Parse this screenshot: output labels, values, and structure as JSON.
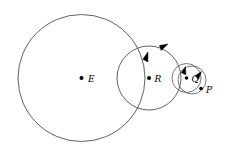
{
  "figure": {
    "background_color": "#ffffff",
    "stroke_color": "#3a3a3a",
    "dot_color": "#000000",
    "arrow_color": "#000000",
    "width": 225,
    "height": 157,
    "points": [
      {
        "id": "E",
        "label": "E",
        "cx": 81.5,
        "cy": 78.0,
        "label_x": 88.0,
        "label_y": 81.5,
        "dot_r": 2.0
      },
      {
        "id": "R",
        "label": "R",
        "cx": 149.0,
        "cy": 78.0,
        "label_x": 154.5,
        "label_y": 81.5,
        "dot_r": 2.0
      },
      {
        "id": "Q",
        "label": "Q",
        "cx": 186.5,
        "cy": 78.0,
        "label_x": 191.5,
        "label_y": 81.5,
        "dot_r": 1.8
      },
      {
        "id": "P",
        "label": "P",
        "cx": 201.0,
        "cy": 88.5,
        "label_x": 206.0,
        "label_y": 93.0,
        "dot_r": 1.8
      }
    ],
    "circles": [
      {
        "id": "deferent-E",
        "center": "E",
        "cx": 81.5,
        "cy": 78.0,
        "r": 63.5
      },
      {
        "id": "epicycle-R",
        "center": "R",
        "cx": 149.0,
        "cy": 78.0,
        "r": 32.0
      },
      {
        "id": "epicycle-Q",
        "center": "Q",
        "cx": 186.5,
        "cy": 78.0,
        "r": 14.5
      },
      {
        "id": "epicycle-P",
        "center": "P",
        "cx": 192.0,
        "cy": 80.0,
        "r": 14.0
      }
    ],
    "arrows": [
      {
        "id": "arrow-on-deferent-E",
        "x": 168.0,
        "y": 44.0,
        "angle": -27
      },
      {
        "id": "arrow-on-epicycle-R",
        "x": 148.0,
        "y": 52.0,
        "angle": -72
      },
      {
        "id": "arrow-on-epicycle-Q",
        "x": 185.5,
        "y": 66.5,
        "angle": -75
      },
      {
        "id": "arrow-on-epicycle-P",
        "x": 201.5,
        "y": 71.5,
        "angle": -52
      }
    ]
  }
}
